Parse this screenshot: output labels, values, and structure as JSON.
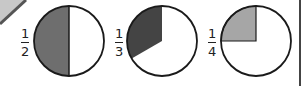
{
  "diagram": {
    "colors": {
      "half_fill": "#6e6e6e",
      "third_fill": "#444444",
      "quarter_fill": "#a6a6a6",
      "outline": "#1a1a1a",
      "corner_fill": "#c8c8c8",
      "corner_stroke": "#555555"
    },
    "items": [
      {
        "numerator": "1",
        "denominator": "2",
        "label": "1/2",
        "shaded_fraction": 0.5
      },
      {
        "numerator": "1",
        "denominator": "3",
        "label": "1/3",
        "shaded_fraction": 0.333
      },
      {
        "numerator": "1",
        "denominator": "4",
        "label": "1/4",
        "shaded_fraction": 0.25
      }
    ]
  }
}
